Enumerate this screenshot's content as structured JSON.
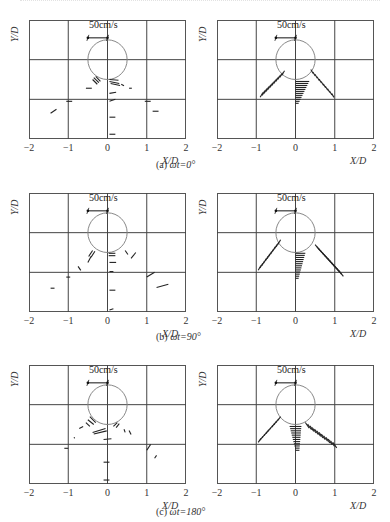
{
  "figure": {
    "x_axis_label": "X/D",
    "y_axis_label": "Y/D",
    "x_ticks": [
      "-2",
      "-1",
      "0",
      "1",
      "2"
    ],
    "scale_bar_label": "50cm/s",
    "captions": [
      {
        "tag": "(a)",
        "phase": "ωt=0°"
      },
      {
        "tag": "(b)",
        "phase": "ωt=90°"
      },
      {
        "tag": "(c)",
        "phase": "ωt=180°"
      }
    ],
    "colors": {
      "frame": "#555555",
      "grid": "#444444",
      "circle": "#888888",
      "vector": "#222222"
    }
  },
  "chart_data": [
    {
      "type": "vector-field",
      "panel": "a-left",
      "caption": "(a) ωt=0°",
      "xlabel": "X/D",
      "ylabel": "Y/D",
      "xlim": [
        -2,
        2
      ],
      "x_ticks": [
        -2,
        -1,
        0,
        1,
        2
      ],
      "grid": true,
      "cylinder": {
        "cx": 0,
        "cy": 1,
        "r": 0.5
      },
      "scale_bar": {
        "label": "50cm/s",
        "x0": -0.5,
        "x1": 0.0,
        "y": 0.45
      },
      "vectors": [
        [
          -0.35,
          1.45,
          -0.22,
          1.58
        ],
        [
          -0.3,
          1.42,
          -0.18,
          1.55
        ],
        [
          -0.38,
          1.5,
          -0.26,
          1.62
        ],
        [
          -0.55,
          1.72,
          -0.4,
          1.72
        ],
        [
          0.05,
          1.5,
          0.28,
          1.52
        ],
        [
          0.05,
          1.55,
          0.3,
          1.6
        ],
        [
          0.08,
          1.6,
          0.32,
          1.65
        ],
        [
          0.35,
          1.62,
          0.42,
          1.66
        ],
        [
          0.55,
          1.72,
          0.62,
          1.72
        ],
        [
          0.05,
          1.85,
          0.22,
          1.82
        ],
        [
          0.05,
          2.05,
          0.2,
          2.0
        ],
        [
          0.05,
          2.45,
          0.2,
          2.45
        ],
        [
          0.05,
          2.88,
          0.2,
          2.88
        ],
        [
          -1.05,
          2.05,
          -0.9,
          2.05
        ],
        [
          0.95,
          2.05,
          1.1,
          2.05
        ],
        [
          1.15,
          2.3,
          1.3,
          2.3
        ],
        [
          -1.45,
          2.35,
          -1.3,
          2.25
        ]
      ]
    },
    {
      "type": "vector-field",
      "panel": "a-right",
      "caption": "(a) ωt=0°",
      "xlabel": "X/D",
      "ylabel": "Y/D",
      "xlim": [
        -2,
        2
      ],
      "x_ticks": [
        -2,
        -1,
        0,
        1,
        2
      ],
      "grid": true,
      "cylinder": {
        "cx": 0,
        "cy": 1,
        "r": 0.5
      },
      "scale_bar": {
        "label": "50cm/s",
        "x0": -0.5,
        "x1": 0.0,
        "y": 0.45
      },
      "vector_groups": [
        {
          "name": "left-branch",
          "from": [
            -0.35,
            1.4
          ],
          "to": [
            -0.9,
            1.95
          ],
          "count": 12,
          "dx": 0.07,
          "dy": -0.12
        },
        {
          "name": "center-branch",
          "from": [
            0.0,
            1.55
          ],
          "to": [
            0.0,
            2.1
          ],
          "count": 12,
          "len_start": 0.35,
          "len_end": 0.08
        },
        {
          "name": "right-branch",
          "from": [
            0.45,
            1.35
          ],
          "to": [
            0.98,
            1.95
          ],
          "count": 11,
          "dx": -0.06,
          "dy": -0.1
        }
      ]
    },
    {
      "type": "vector-field",
      "panel": "b-left",
      "caption": "(b) ωt=90°",
      "xlabel": "X/D",
      "ylabel": "Y/D",
      "xlim": [
        -2,
        2
      ],
      "x_ticks": [
        -2,
        -1,
        0,
        1,
        2
      ],
      "grid": true,
      "cylinder": {
        "cx": 0,
        "cy": 1,
        "r": 0.5
      },
      "scale_bar": {
        "label": "50cm/s",
        "x0": -0.5,
        "x1": 0.0,
        "y": 0.45
      },
      "vectors": [
        [
          -0.48,
          1.6,
          -0.38,
          1.45
        ],
        [
          -0.42,
          1.62,
          -0.32,
          1.47
        ],
        [
          -0.5,
          1.75,
          -0.42,
          1.6
        ],
        [
          -0.75,
          1.85,
          -0.68,
          1.95
        ],
        [
          0.03,
          1.52,
          0.2,
          1.52
        ],
        [
          0.03,
          1.58,
          0.2,
          1.58
        ],
        [
          0.05,
          1.75,
          0.22,
          1.75
        ],
        [
          0.05,
          1.98,
          0.15,
          1.98
        ],
        [
          0.05,
          2.45,
          0.2,
          2.45
        ],
        [
          0.05,
          2.95,
          0.15,
          2.92
        ],
        [
          0.45,
          1.45,
          0.52,
          1.55
        ],
        [
          0.6,
          1.65,
          0.72,
          1.5
        ],
        [
          -1.05,
          2.12,
          -0.95,
          2.12
        ],
        [
          -1.45,
          2.4,
          -1.35,
          2.4
        ],
        [
          1.0,
          2.12,
          1.2,
          2.0
        ],
        [
          1.25,
          2.38,
          1.55,
          2.3
        ]
      ]
    },
    {
      "type": "vector-field",
      "panel": "b-right",
      "caption": "(b) ωt=90°",
      "xlabel": "X/D",
      "ylabel": "Y/D",
      "xlim": [
        -2,
        2
      ],
      "x_ticks": [
        -2,
        -1,
        0,
        1,
        2
      ],
      "grid": true,
      "cylinder": {
        "cx": 0,
        "cy": 1,
        "r": 0.5
      },
      "scale_bar": {
        "label": "50cm/s",
        "x0": -0.5,
        "x1": 0.0,
        "y": 0.45
      },
      "vector_groups": [
        {
          "name": "left-branch",
          "from": [
            -0.45,
            1.3
          ],
          "to": [
            -0.95,
            1.95
          ],
          "count": 12,
          "dx": 0.07,
          "dy": -0.12
        },
        {
          "name": "center-branch",
          "from": [
            0.0,
            1.52
          ],
          "to": [
            0.0,
            2.15
          ],
          "count": 13,
          "len_start": 0.25,
          "len_end": 0.08
        },
        {
          "name": "right-branch",
          "from": [
            0.5,
            1.3
          ],
          "to": [
            1.1,
            1.95
          ],
          "count": 14,
          "dx": 0.12,
          "dy": 0.15
        }
      ]
    },
    {
      "type": "vector-field",
      "panel": "c-left",
      "caption": "(c) ωt=180°",
      "xlabel": "X/D",
      "ylabel": "Y/D",
      "xlim": [
        -2,
        2
      ],
      "x_ticks": [
        -2,
        -1,
        0,
        1,
        2
      ],
      "grid": true,
      "cylinder": {
        "cx": 0,
        "cy": 1,
        "r": 0.5
      },
      "scale_bar": {
        "label": "50cm/s",
        "x0": -0.5,
        "x1": 0.0,
        "y": 0.45
      },
      "vectors": [
        [
          -0.45,
          1.3,
          -0.3,
          1.45
        ],
        [
          -0.5,
          1.38,
          -0.35,
          1.5
        ],
        [
          -0.55,
          1.45,
          -0.45,
          1.55
        ],
        [
          -0.72,
          1.6,
          -0.62,
          1.55
        ],
        [
          -0.85,
          1.82,
          -0.84,
          1.85
        ],
        [
          -0.38,
          1.7,
          -0.05,
          1.6
        ],
        [
          -0.35,
          1.74,
          -0.02,
          1.66
        ],
        [
          0.15,
          1.55,
          0.25,
          1.45
        ],
        [
          0.22,
          1.58,
          0.3,
          1.48
        ],
        [
          0.42,
          1.62,
          0.45,
          1.7
        ],
        [
          0.55,
          1.65,
          0.6,
          1.75
        ],
        [
          -0.1,
          1.88,
          0.1,
          1.86
        ],
        [
          -1.1,
          2.1,
          -1.0,
          2.1
        ],
        [
          -0.1,
          2.45,
          0.05,
          2.45
        ],
        [
          -0.1,
          2.9,
          0.05,
          2.9
        ],
        [
          1.0,
          2.15,
          1.1,
          2.0
        ],
        [
          1.2,
          2.35,
          1.25,
          2.28
        ]
      ]
    },
    {
      "type": "vector-field",
      "panel": "c-right",
      "caption": "(c) ωt=180°",
      "xlabel": "X/D",
      "ylabel": "Y/D",
      "xlim": [
        -2,
        2
      ],
      "x_ticks": [
        -2,
        -1,
        0,
        1,
        2
      ],
      "grid": true,
      "cylinder": {
        "cx": 0,
        "cy": 1,
        "r": 0.5
      },
      "scale_bar": {
        "label": "50cm/s",
        "x0": -0.5,
        "x1": 0.0,
        "y": 0.45
      },
      "vector_groups": [
        {
          "name": "left-branch",
          "from": [
            -0.45,
            1.4
          ],
          "to": [
            -0.95,
            1.95
          ],
          "count": 11,
          "dx": 0.07,
          "dy": -0.1
        },
        {
          "name": "center-branch",
          "from": [
            -0.15,
            1.55
          ],
          "to": [
            0.0,
            2.15
          ],
          "count": 12,
          "len_start": 0.3,
          "len_end": 0.1
        },
        {
          "name": "right-branch",
          "from": [
            0.25,
            1.45
          ],
          "to": [
            0.95,
            1.95
          ],
          "count": 13,
          "dx": 0.1,
          "dy": 0.14
        }
      ]
    }
  ]
}
